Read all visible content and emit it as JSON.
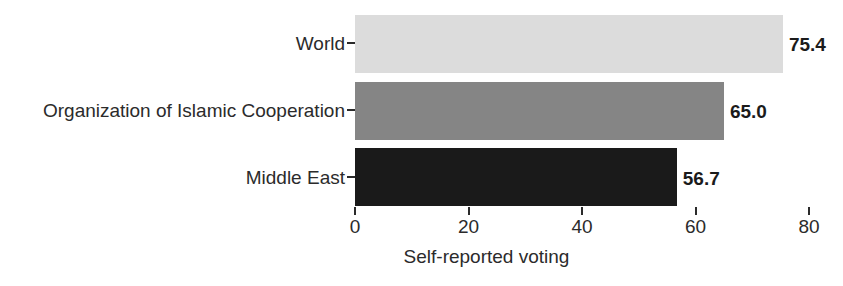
{
  "chart_data": {
    "type": "bar",
    "orientation": "horizontal",
    "title": "",
    "subtitle": "",
    "xlabel": "Self-reported voting",
    "ylabel": "",
    "categories": [
      "World",
      "Organization of Islamic Cooperation",
      "Middle East"
    ],
    "values": [
      75.4,
      65.0,
      56.7
    ],
    "value_labels": [
      "75.4",
      "65.0",
      "56.7"
    ],
    "bar_colors": [
      "#dcdcdc",
      "#858585",
      "#1a1a1a"
    ],
    "xlim": [
      0,
      83
    ],
    "xticks": [
      0,
      20,
      40,
      60,
      80
    ],
    "xtick_labels": [
      "0",
      "20",
      "40",
      "60",
      "80"
    ],
    "grid": false,
    "legend": false,
    "legend_position": "none",
    "background_color": "#ffffff",
    "axis_color": "#2b2b2b"
  }
}
